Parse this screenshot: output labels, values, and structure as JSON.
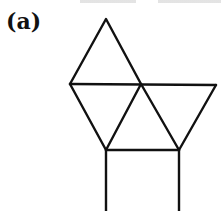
{
  "figure": {
    "label": "(a)",
    "stroke_color": "#111111",
    "stroke_width": 2.4,
    "vertices": {
      "apex": [
        106,
        19
      ],
      "left": [
        70,
        84
      ],
      "middle": [
        141,
        84
      ],
      "right": [
        216,
        85
      ],
      "lower_left": [
        106,
        150
      ],
      "lower_right": [
        179,
        150
      ],
      "bottom_left": [
        106,
        211
      ],
      "bottom_right": [
        179,
        211
      ]
    }
  }
}
